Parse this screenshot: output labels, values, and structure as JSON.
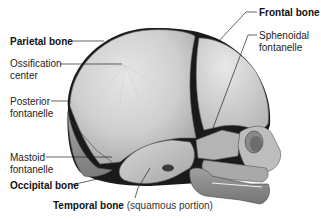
{
  "figure": {
    "colors": {
      "bone_light": "#dcdcdc",
      "bone_mid": "#bdbdbd",
      "bone_dark": "#8e8e8e",
      "fontanelle": "#111111",
      "leader_line": "#222222",
      "label_text": "#1e1e1e"
    }
  },
  "labels": {
    "parietal_bone": "Parietal bone",
    "ossification_center_1": "Ossification",
    "ossification_center_2": "center",
    "posterior_fontanelle_1": "Posterior",
    "posterior_fontanelle_2": "fontanelle",
    "mastoid_fontanelle_1": "Mastoid",
    "mastoid_fontanelle_2": "fontanelle",
    "occipital_bone": "Occipital bone",
    "temporal_bone": "Temporal bone",
    "temporal_bone_note": "(squamous portion)",
    "frontal_bone": "Frontal bone",
    "sphenoidal_fontanelle_1": "Sphenoidal",
    "sphenoidal_fontanelle_2": "fontanelle"
  }
}
